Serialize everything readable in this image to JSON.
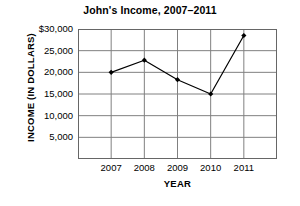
{
  "chart_data": {
    "type": "line",
    "title": "John's Income, 2007–2011",
    "xlabel": "YEAR",
    "ylabel": "INCOME (IN DOLLARS)",
    "categories": [
      "2007",
      "2008",
      "2009",
      "2010",
      "2011"
    ],
    "values": [
      20000,
      22800,
      18300,
      15000,
      28500
    ],
    "series": [
      {
        "name": "Income",
        "values": [
          20000,
          22800,
          18300,
          15000,
          28500
        ]
      }
    ],
    "ylim": [
      0,
      30000
    ],
    "ytick_values": [
      30000,
      25000,
      20000,
      15000,
      10000,
      5000
    ],
    "ytick_labels": [
      "$30,000",
      "25,000",
      "20,000",
      "15,000",
      "10,000",
      "5,000"
    ],
    "xtick_labels": [
      "2007",
      "2008",
      "2009",
      "2010",
      "2011"
    ],
    "grid": true,
    "legend": "none",
    "marker": "diamond",
    "colors": {
      "line": "#000000",
      "marker": "#000000",
      "grid": "#808080",
      "axis": "#555555",
      "background": "#ffffff",
      "text": "#000000"
    }
  }
}
